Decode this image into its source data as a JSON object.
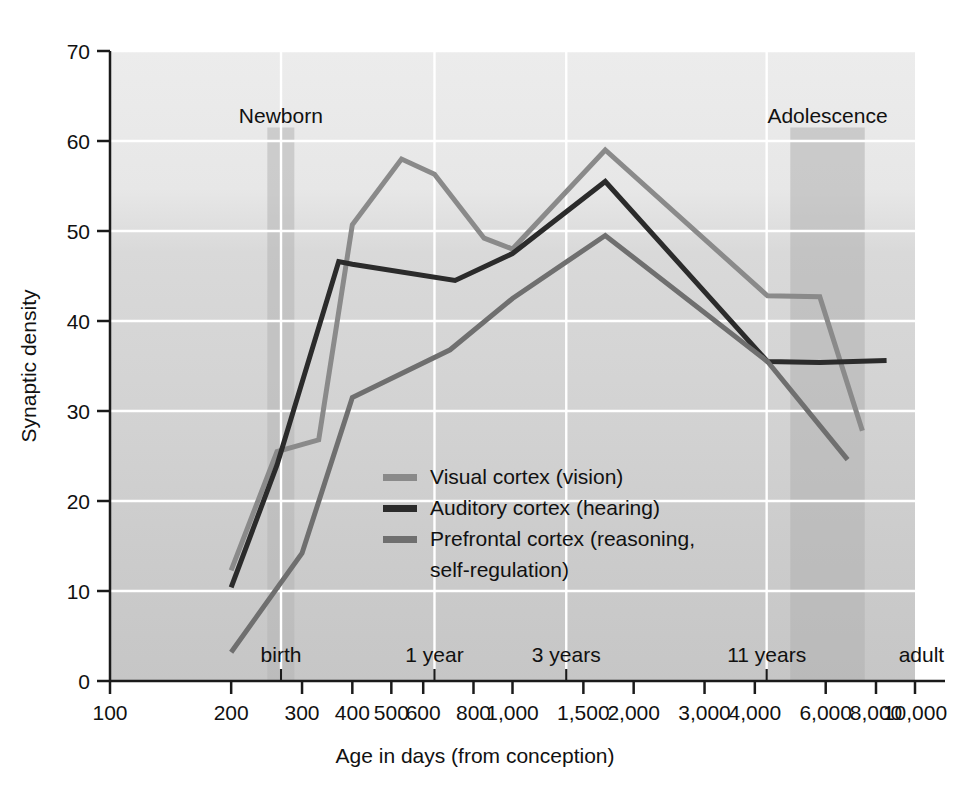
{
  "chart_data": {
    "type": "line",
    "title": "",
    "xlabel": "Age in days (from conception)",
    "ylabel": "Synaptic density",
    "xscale": "log",
    "xlim": [
      100,
      10000
    ],
    "ylim": [
      0,
      70
    ],
    "grid": true,
    "legend_position": "center-left-inside",
    "x_tick_labels": [
      "100",
      "200",
      "300",
      "400",
      "500",
      "600",
      "800",
      "1,000",
      "1,500",
      "2,000",
      "3,000",
      "4,000",
      "6,000",
      "8,000",
      "10,000"
    ],
    "x_tick_values": [
      100,
      200,
      300,
      400,
      500,
      600,
      800,
      1000,
      1500,
      2000,
      3000,
      4000,
      6000,
      8000,
      10000
    ],
    "y_tick_labels": [
      "0",
      "10",
      "20",
      "30",
      "40",
      "50",
      "60",
      "70"
    ],
    "y_tick_values": [
      0,
      10,
      20,
      30,
      40,
      50,
      60,
      70
    ],
    "stage_markers": [
      {
        "label": "birth",
        "x": 266
      },
      {
        "label": "1 year",
        "x": 640
      },
      {
        "label": "3 years",
        "x": 1360
      },
      {
        "label": "11 years",
        "x": 4280
      },
      {
        "label": "adult",
        "x": 9400
      }
    ],
    "bands": [
      {
        "label": "Newborn",
        "x_start": 246,
        "x_end": 287,
        "color": "#b4b4b4"
      },
      {
        "label": "Adolescence",
        "x_start": 4900,
        "x_end": 7500,
        "color": "#b0b0b0"
      }
    ],
    "series": [
      {
        "name": "Visual cortex (vision)",
        "color": "#8a8a8a",
        "points": [
          [
            200,
            12.3
          ],
          [
            260,
            25.5
          ],
          [
            330,
            26.8
          ],
          [
            400,
            50.7
          ],
          [
            530,
            58.0
          ],
          [
            640,
            56.3
          ],
          [
            850,
            49.2
          ],
          [
            1000,
            48.0
          ],
          [
            1700,
            59.0
          ],
          [
            4300,
            42.8
          ],
          [
            5800,
            42.7
          ],
          [
            7400,
            27.8
          ]
        ]
      },
      {
        "name": "Auditory cortex (hearing)",
        "color": "#2b2b2b",
        "points": [
          [
            200,
            10.4
          ],
          [
            260,
            24.0
          ],
          [
            370,
            46.6
          ],
          [
            400,
            46.3
          ],
          [
            720,
            44.5
          ],
          [
            1000,
            47.5
          ],
          [
            1700,
            55.5
          ],
          [
            4300,
            35.5
          ],
          [
            5800,
            35.4
          ],
          [
            8500,
            35.6
          ]
        ]
      },
      {
        "name": "Prefrontal cortex (reasoning, self-regulation)",
        "color": "#6f6f6f",
        "points": [
          [
            200,
            3.2
          ],
          [
            300,
            14.2
          ],
          [
            400,
            31.5
          ],
          [
            700,
            36.8
          ],
          [
            1000,
            42.5
          ],
          [
            1700,
            49.5
          ],
          [
            4300,
            35.5
          ],
          [
            6800,
            24.6
          ]
        ]
      }
    ]
  },
  "axes": {
    "y_title": "Synaptic density",
    "x_title": "Age in days (from conception)"
  },
  "legend": {
    "entries": [
      {
        "label": "Visual cortex (vision)",
        "swatch": "#8a8a8a"
      },
      {
        "label": "Auditory cortex (hearing)",
        "swatch": "#2b2b2b"
      },
      {
        "label": "Prefrontal cortex (reasoning,",
        "swatch": "#6f6f6f"
      },
      {
        "label": "self-regulation)",
        "swatch": ""
      }
    ]
  },
  "colors": {
    "plot_background_top": "#ebebeb",
    "plot_background_bottom": "#c9c9c9",
    "gridline": "#ffffff",
    "axis": "#1a1a1a",
    "visual": "#8a8a8a",
    "auditory": "#2b2b2b",
    "prefrontal": "#6f6f6f"
  }
}
